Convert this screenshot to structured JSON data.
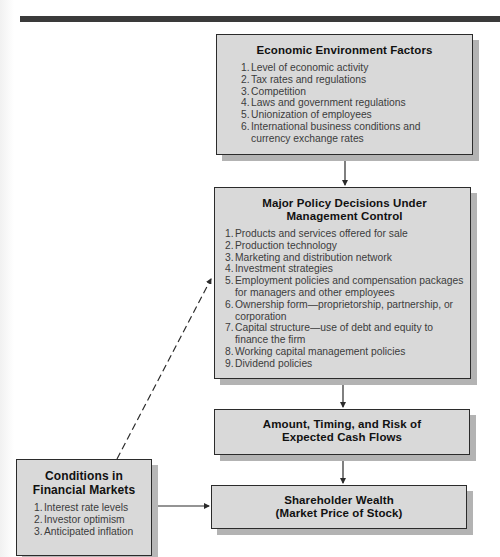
{
  "diagram": {
    "economic_environment": {
      "title": "Economic Environment Factors",
      "items": [
        {
          "num": "1.",
          "text": "Level of  economic activity"
        },
        {
          "num": "2.",
          "text": "Tax rates and regulations"
        },
        {
          "num": "3.",
          "text": "Competition"
        },
        {
          "num": "4.",
          "text": "Laws and government regulations"
        },
        {
          "num": "5.",
          "text": "Unionization of employees"
        },
        {
          "num": "6.",
          "text": "International business conditions and currency exchange rates"
        }
      ]
    },
    "policy_decisions": {
      "title_line1": "Major Policy Decisions Under",
      "title_line2": "Management Control",
      "items": [
        {
          "num": "1.",
          "text": "Products and services offered for sale"
        },
        {
          "num": "2.",
          "text": "Production technology"
        },
        {
          "num": "3.",
          "text": "Marketing and distribution network"
        },
        {
          "num": "4.",
          "text": "Investment strategies"
        },
        {
          "num": "5.",
          "text": "Employment policies and compensation packages for managers and other employees"
        },
        {
          "num": "6.",
          "text": "Ownership form—proprietorship, partnership, or corporation"
        },
        {
          "num": "7.",
          "text": "Capital structure—use of debt and equity to finance the firm"
        },
        {
          "num": "8.",
          "text": "Working capital management policies"
        },
        {
          "num": "9.",
          "text": "Dividend policies"
        }
      ]
    },
    "cash_flows": {
      "title_line1": "Amount, Timing, and Risk of",
      "title_line2": "Expected Cash Flows"
    },
    "shareholder_wealth": {
      "title_line1": "Shareholder Wealth",
      "title_line2": "(Market Price of Stock)"
    },
    "financial_markets": {
      "title_line1": "Conditions in",
      "title_line2": "Financial Markets",
      "items": [
        {
          "num": "1.",
          "text": "Interest rate levels"
        },
        {
          "num": "2.",
          "text": "Investor optimism"
        },
        {
          "num": "3.",
          "text": "Anticipated inflation"
        }
      ]
    },
    "connections": [
      {
        "from": "economic_environment",
        "to": "policy_decisions",
        "style": "solid"
      },
      {
        "from": "policy_decisions",
        "to": "cash_flows",
        "style": "solid"
      },
      {
        "from": "cash_flows",
        "to": "shareholder_wealth",
        "style": "solid"
      },
      {
        "from": "financial_markets",
        "to": "shareholder_wealth",
        "style": "solid"
      },
      {
        "from": "financial_markets",
        "to": "policy_decisions",
        "style": "dashed"
      }
    ],
    "colors": {
      "box_fill": "#d9d9d9",
      "box_border": "#2b2b2b",
      "box_shadow": "#b3b3b3",
      "header_bar": "#3a3a3a"
    }
  }
}
